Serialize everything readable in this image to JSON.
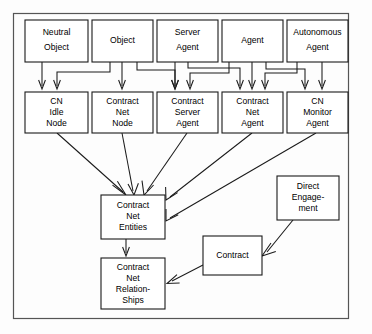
{
  "diagram": {
    "frame": {
      "name": "diagram-border"
    },
    "colors": {
      "background": "#fdfdfd",
      "node_fill": "#ffffff",
      "node_stroke": "#1a1a1a",
      "frame_stroke": "#555555",
      "edge": "#1a1a1a"
    },
    "nodes": [
      {
        "id": "neutral-object",
        "label": "Neutral\nObject",
        "x": 25,
        "y": 20,
        "w": 63,
        "h": 42
      },
      {
        "id": "object",
        "label": "Object",
        "x": 92,
        "y": 20,
        "w": 61,
        "h": 42
      },
      {
        "id": "server-agent",
        "label": "Server\nAgent",
        "x": 157,
        "y": 20,
        "w": 61,
        "h": 42
      },
      {
        "id": "agent",
        "label": "Agent",
        "x": 222,
        "y": 20,
        "w": 61,
        "h": 42
      },
      {
        "id": "autonomous-agent",
        "label": "Autonomous\nAgent",
        "x": 287,
        "y": 20,
        "w": 61,
        "h": 42
      },
      {
        "id": "cn-idle-node",
        "label": "CN\nIdle\nNode",
        "x": 25,
        "y": 92,
        "w": 63,
        "h": 41
      },
      {
        "id": "contract-net-node",
        "label": "Contract\nNet\nNode",
        "x": 92,
        "y": 92,
        "w": 61,
        "h": 41
      },
      {
        "id": "contract-server-agent",
        "label": "Contract\nServer\nAgent",
        "x": 157,
        "y": 92,
        "w": 61,
        "h": 41
      },
      {
        "id": "contract-net-agent",
        "label": "Contract\nNet\nAgent",
        "x": 222,
        "y": 92,
        "w": 61,
        "h": 41
      },
      {
        "id": "cn-monitor-agent",
        "label": "CN\nMonitor\nAgent",
        "x": 287,
        "y": 92,
        "w": 61,
        "h": 41
      },
      {
        "id": "contract-net-entities",
        "label": "Contract\nNet\nEntities",
        "x": 101,
        "y": 195,
        "w": 64,
        "h": 44
      },
      {
        "id": "contract-net-relationships",
        "label": "Contract\nNet\nRelation-\nShips",
        "x": 101,
        "y": 258,
        "w": 64,
        "h": 51
      },
      {
        "id": "contract",
        "label": "Contract",
        "x": 203,
        "y": 236,
        "w": 59,
        "h": 39
      },
      {
        "id": "direct-engagement",
        "label": "Direct\nEngage-\nment",
        "x": 277,
        "y": 176,
        "w": 62,
        "h": 44
      }
    ],
    "edges": [
      {
        "id": "edge-neutral-object-to-cn-idle-node",
        "from": "neutral-object",
        "to": "cn-idle-node"
      },
      {
        "id": "edge-object-to-cn-idle-node",
        "from": "object",
        "to": "cn-idle-node"
      },
      {
        "id": "edge-object-to-contract-net-node",
        "from": "object",
        "to": "contract-net-node"
      },
      {
        "id": "edge-object-to-contract-server-agent",
        "from": "object",
        "to": "contract-server-agent"
      },
      {
        "id": "edge-server-agent-to-contract-server-agent",
        "from": "server-agent",
        "to": "contract-server-agent"
      },
      {
        "id": "edge-server-agent-to-contract-net-agent",
        "from": "server-agent",
        "to": "contract-net-agent"
      },
      {
        "id": "edge-agent-to-contract-server-agent",
        "from": "agent",
        "to": "contract-server-agent"
      },
      {
        "id": "edge-agent-to-contract-net-agent",
        "from": "agent",
        "to": "contract-net-agent"
      },
      {
        "id": "edge-agent-to-cn-monitor-agent",
        "from": "agent",
        "to": "cn-monitor-agent"
      },
      {
        "id": "edge-autonomous-agent-to-contract-net-agent",
        "from": "autonomous-agent",
        "to": "contract-net-agent"
      },
      {
        "id": "edge-autonomous-agent-to-cn-monitor-agent",
        "from": "autonomous-agent",
        "to": "cn-monitor-agent"
      },
      {
        "id": "edge-cn-idle-node-to-entities",
        "from": "cn-idle-node",
        "to": "contract-net-entities"
      },
      {
        "id": "edge-contract-net-node-to-entities",
        "from": "contract-net-node",
        "to": "contract-net-entities"
      },
      {
        "id": "edge-contract-server-agent-to-entities",
        "from": "contract-server-agent",
        "to": "contract-net-entities"
      },
      {
        "id": "edge-contract-net-agent-to-entities",
        "from": "contract-net-agent",
        "to": "contract-net-entities"
      },
      {
        "id": "edge-cn-monitor-agent-to-entities",
        "from": "cn-monitor-agent",
        "to": "contract-net-entities"
      },
      {
        "id": "edge-entities-to-relationships",
        "from": "contract-net-entities",
        "to": "contract-net-relationships"
      },
      {
        "id": "edge-contract-to-relationships",
        "from": "contract",
        "to": "contract-net-relationships"
      },
      {
        "id": "edge-direct-engagement-to-contract",
        "from": "direct-engagement",
        "to": "contract"
      }
    ]
  }
}
